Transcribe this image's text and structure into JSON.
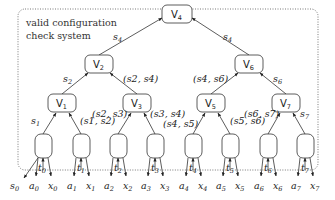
{
  "box": {
    "title_line1": "valid configuration",
    "title_line2": "check system"
  },
  "nodes": [
    {
      "id": "V4",
      "base": "V",
      "sub": "4",
      "x": 177,
      "y": 14
    },
    {
      "id": "V2",
      "base": "V",
      "sub": "2",
      "x": 99,
      "y": 64
    },
    {
      "id": "V6",
      "base": "V",
      "sub": "6",
      "x": 249,
      "y": 64
    },
    {
      "id": "V1",
      "base": "V",
      "sub": "1",
      "x": 62,
      "y": 103
    },
    {
      "id": "V3",
      "base": "V",
      "sub": "3",
      "x": 137,
      "y": 103
    },
    {
      "id": "V5",
      "base": "V",
      "sub": "5",
      "x": 211,
      "y": 103
    },
    {
      "id": "V7",
      "base": "V",
      "sub": "7",
      "x": 286,
      "y": 103
    }
  ],
  "leaves": [
    {
      "id": "L0",
      "x": 43,
      "y": 146
    },
    {
      "id": "L1",
      "x": 81,
      "y": 146
    },
    {
      "id": "L2",
      "x": 118,
      "y": 146
    },
    {
      "id": "L3",
      "x": 155,
      "y": 146
    },
    {
      "id": "L4",
      "x": 193,
      "y": 146
    },
    {
      "id": "L5",
      "x": 230,
      "y": 146
    },
    {
      "id": "L6",
      "x": 268,
      "y": 146
    },
    {
      "id": "L7",
      "x": 305,
      "y": 146
    }
  ],
  "edge_labels": {
    "v2_v4": {
      "base": "s",
      "sub": "4"
    },
    "v6_v4": {
      "base": "s",
      "sub": "4"
    },
    "v1_v2": {
      "base": "s",
      "sub": "2"
    },
    "v3_v2": {
      "text": "(s2, s4)"
    },
    "v5_v6": {
      "text": "(s4, s6)"
    },
    "v7_v6": {
      "base": "s",
      "sub": "6"
    },
    "l0_v1": {
      "base": "s",
      "sub": "1"
    },
    "l1_v1": {
      "text": "(s1, s2)"
    },
    "l2_v3": {
      "text": "(s2, s3)"
    },
    "l3_v3": {
      "text": "(s3, s4)"
    },
    "l4_v5": {
      "text": "(s4, s5)"
    },
    "l5_v5": {
      "text": "(s5, s6)"
    },
    "l6_v7": {
      "text": "(s6, s7)"
    },
    "l7_v7": {
      "base": "s",
      "sub": "7"
    }
  },
  "inputs": {
    "t": [
      "t0",
      "t1",
      "t2",
      "t3",
      "t4",
      "t5",
      "t6",
      "t7"
    ]
  },
  "bottom_labels": [
    {
      "base": "s",
      "sub": "0"
    },
    {
      "base": "a",
      "sub": "0"
    },
    {
      "base": "x",
      "sub": "0"
    },
    {
      "base": "a",
      "sub": "1"
    },
    {
      "base": "x",
      "sub": "1"
    },
    {
      "base": "a",
      "sub": "2"
    },
    {
      "base": "x",
      "sub": "2"
    },
    {
      "base": "a",
      "sub": "3"
    },
    {
      "base": "x",
      "sub": "3"
    },
    {
      "base": "a",
      "sub": "4"
    },
    {
      "base": "x",
      "sub": "4"
    },
    {
      "base": "a",
      "sub": "5"
    },
    {
      "base": "x",
      "sub": "5"
    },
    {
      "base": "a",
      "sub": "6"
    },
    {
      "base": "x",
      "sub": "6"
    },
    {
      "base": "a",
      "sub": "7"
    },
    {
      "base": "x",
      "sub": "7"
    }
  ],
  "t_labels": [
    {
      "base": "t",
      "sub": "0"
    },
    {
      "base": "t",
      "sub": "1"
    },
    {
      "base": "t",
      "sub": "2"
    },
    {
      "base": "t",
      "sub": "3"
    },
    {
      "base": "t",
      "sub": "4"
    },
    {
      "base": "t",
      "sub": "5"
    },
    {
      "base": "t",
      "sub": "6"
    },
    {
      "base": "t",
      "sub": "7"
    }
  ],
  "colors": {
    "stroke": "#333333",
    "box_border": "#555555"
  }
}
